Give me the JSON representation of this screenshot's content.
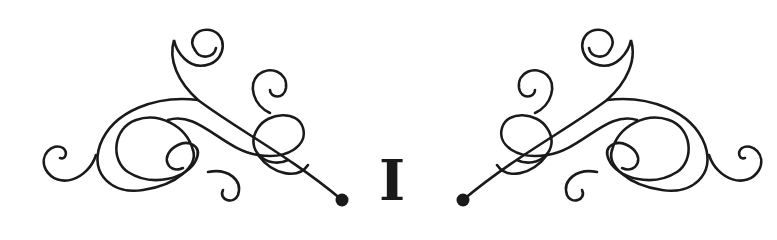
{
  "chapter": {
    "numeral": "I"
  },
  "colors": {
    "ink": "#1a1a1a",
    "background": "#ffffff"
  },
  "ornaments": [
    {
      "side": "left",
      "icon": "flourish-swirl-icon"
    },
    {
      "side": "right",
      "icon": "flourish-swirl-icon"
    }
  ]
}
